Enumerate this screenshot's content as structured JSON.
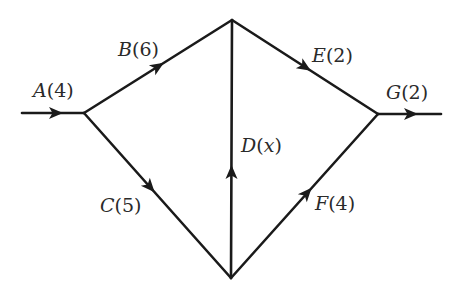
{
  "diagram": {
    "type": "activity-network",
    "nodes": {
      "start": {
        "x": 22,
        "y": 113
      },
      "left": {
        "x": 84,
        "y": 113
      },
      "top": {
        "x": 232,
        "y": 20
      },
      "bottom": {
        "x": 231,
        "y": 278
      },
      "right": {
        "x": 378,
        "y": 114
      },
      "end": {
        "x": 441,
        "y": 114
      }
    },
    "edges": [
      {
        "id": "A",
        "letter": "A",
        "value": "4",
        "from": "start",
        "to": "left"
      },
      {
        "id": "B",
        "letter": "B",
        "value": "6",
        "from": "left",
        "to": "top"
      },
      {
        "id": "C",
        "letter": "C",
        "value": "5",
        "from": "left",
        "to": "bottom"
      },
      {
        "id": "D",
        "letter": "D",
        "value": "x",
        "from": "bottom",
        "to": "top"
      },
      {
        "id": "E",
        "letter": "E",
        "value": "2",
        "from": "top",
        "to": "right"
      },
      {
        "id": "F",
        "letter": "F",
        "value": "4",
        "from": "bottom",
        "to": "right"
      },
      {
        "id": "G",
        "letter": "G",
        "value": "2",
        "from": "right",
        "to": "end"
      }
    ],
    "labels": {
      "A": {
        "letter": "A",
        "open": "(",
        "value": "4",
        "close": ")"
      },
      "B": {
        "letter": "B",
        "open": "(",
        "value": "6",
        "close": ")"
      },
      "C": {
        "letter": "C",
        "open": "(",
        "value": "5",
        "close": ")"
      },
      "D": {
        "letter": "D",
        "open": "(",
        "value": "x",
        "close": ")"
      },
      "E": {
        "letter": "E",
        "open": "(",
        "value": "2",
        "close": ")"
      },
      "F": {
        "letter": "F",
        "open": "(",
        "value": "4",
        "close": ")"
      },
      "G": {
        "letter": "G",
        "open": "(",
        "value": "2",
        "close": ")"
      }
    },
    "colors": {
      "line": "#1a1a1a",
      "text": "#2a2a2a",
      "background": "#ffffff"
    }
  }
}
